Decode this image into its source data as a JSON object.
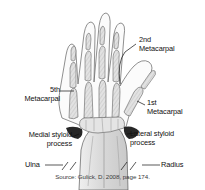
{
  "figure": {
    "source_note": "Source: Gulick, D. 2008, page 174."
  },
  "labels": {
    "second_metacarpal": "2nd\nMetacarpal",
    "fifth_metacarpal": "5th\nMetacarpal",
    "first_metacarpal": "1st\nMetacarpal",
    "medial_styloid_process": "Medial styloid\nprocess",
    "lateral_styloid_process": "Lateral styloid\nprocess",
    "ulna": "Ulna",
    "radius": "Radius"
  },
  "colors": {
    "background": "#ffffff",
    "ink": "#111111",
    "bone_fill": "#d8d8d8",
    "bone_light": "#ededed",
    "shadow": "#2b2b2b",
    "outline": "#4a4a4a"
  }
}
